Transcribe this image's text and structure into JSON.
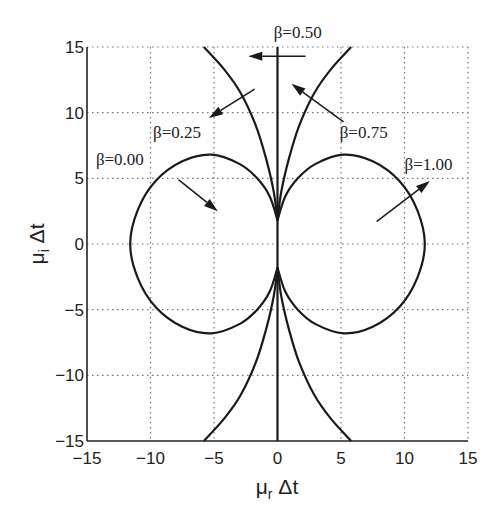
{
  "chart_data": {
    "type": "line",
    "title": "",
    "xlabel": "μr Δt",
    "ylabel": "μi Δt",
    "xlim": [
      -15,
      15
    ],
    "ylim": [
      -15,
      15
    ],
    "grid": true,
    "xticks": [
      -15,
      -10,
      -5,
      0,
      5,
      10,
      15
    ],
    "yticks": [
      -15,
      -10,
      -5,
      0,
      5,
      10,
      15
    ],
    "xtick_labels": [
      "−15",
      "−10",
      "−5",
      "0",
      "5",
      "10",
      "15"
    ],
    "ytick_labels": [
      "−15",
      "−10",
      "−5",
      "0",
      "5",
      "10",
      "15"
    ],
    "series": [
      {
        "name": "β=0.00",
        "shape": "closed lobe, left half-plane",
        "points": [
          [
            0,
            1.8
          ],
          [
            -0.6,
            3.6
          ],
          [
            -1.6,
            5.0
          ],
          [
            -3.0,
            6.1
          ],
          [
            -5.2,
            6.8
          ],
          [
            -7.5,
            6.3
          ],
          [
            -9.6,
            4.8
          ],
          [
            -11.0,
            2.6
          ],
          [
            -11.6,
            0
          ],
          [
            -11.0,
            -2.6
          ],
          [
            -9.6,
            -4.8
          ],
          [
            -7.5,
            -6.3
          ],
          [
            -5.2,
            -6.8
          ],
          [
            -3.0,
            -6.1
          ],
          [
            -1.6,
            -5.0
          ],
          [
            -0.6,
            -3.6
          ],
          [
            0,
            -1.8
          ]
        ]
      },
      {
        "name": "β=0.25",
        "shape": "open curves bending left",
        "points": [
          [
            -5.8,
            15
          ],
          [
            -4.2,
            13.3
          ],
          [
            -2.9,
            11.5
          ],
          [
            -1.7,
            9
          ],
          [
            -0.9,
            6.5
          ],
          [
            -0.3,
            4
          ],
          [
            0,
            1.8
          ]
        ],
        "points_mirror": [
          [
            -5.8,
            -15
          ],
          [
            -4.2,
            -13.3
          ],
          [
            -2.9,
            -11.5
          ],
          [
            -1.7,
            -9
          ],
          [
            -0.9,
            -6.5
          ],
          [
            -0.3,
            -4
          ],
          [
            0,
            -1.8
          ]
        ]
      },
      {
        "name": "β=0.50",
        "shape": "imaginary axis",
        "points": [
          [
            0,
            15
          ],
          [
            0,
            -15
          ]
        ]
      },
      {
        "name": "β=0.75",
        "shape": "open curves bending right",
        "points": [
          [
            5.8,
            15
          ],
          [
            4.2,
            13.3
          ],
          [
            2.9,
            11.5
          ],
          [
            1.7,
            9
          ],
          [
            0.9,
            6.5
          ],
          [
            0.3,
            4
          ],
          [
            0,
            1.8
          ]
        ],
        "points_mirror": [
          [
            5.8,
            -15
          ],
          [
            4.2,
            -13.3
          ],
          [
            2.9,
            -11.5
          ],
          [
            1.7,
            -9
          ],
          [
            0.9,
            -6.5
          ],
          [
            0.3,
            -4
          ],
          [
            0,
            -1.8
          ]
        ]
      },
      {
        "name": "β=1.00",
        "shape": "closed lobe, right half-plane",
        "points": [
          [
            0,
            1.8
          ],
          [
            0.6,
            3.6
          ],
          [
            1.6,
            5.0
          ],
          [
            3.0,
            6.1
          ],
          [
            5.2,
            6.8
          ],
          [
            7.5,
            6.3
          ],
          [
            9.6,
            4.8
          ],
          [
            11.0,
            2.6
          ],
          [
            11.6,
            0
          ],
          [
            11.0,
            -2.6
          ],
          [
            9.6,
            -4.8
          ],
          [
            7.5,
            -6.3
          ],
          [
            5.2,
            -6.8
          ],
          [
            3.0,
            -6.1
          ],
          [
            1.6,
            -5.0
          ],
          [
            0.6,
            -3.6
          ],
          [
            0,
            -1.8
          ]
        ]
      }
    ],
    "annotations": [
      {
        "text": "β=0.00",
        "label_at": [
          -14.3,
          6.0
        ],
        "arrow_from": [
          -7.8,
          4.9
        ],
        "arrow_to": [
          -4.7,
          2.5
        ]
      },
      {
        "text": "β=0.25",
        "label_at": [
          -9.8,
          8.1
        ],
        "arrow_from": [
          -1.8,
          11.8
        ],
        "arrow_to": [
          -5.4,
          9.6
        ]
      },
      {
        "text": "β=0.50",
        "label_at": [
          -0.3,
          15.7
        ],
        "arrow_from": [
          2.2,
          14.3
        ],
        "arrow_to": [
          -2.3,
          14.3
        ]
      },
      {
        "text": "β=0.75",
        "label_at": [
          4.9,
          8.1
        ],
        "arrow_from": [
          5.2,
          9.3
        ],
        "arrow_to": [
          1.1,
          12.2
        ]
      },
      {
        "text": "β=1.00",
        "label_at": [
          10.0,
          5.6
        ],
        "arrow_from": [
          7.8,
          1.7
        ],
        "arrow_to": [
          12.0,
          4.8
        ]
      }
    ]
  }
}
